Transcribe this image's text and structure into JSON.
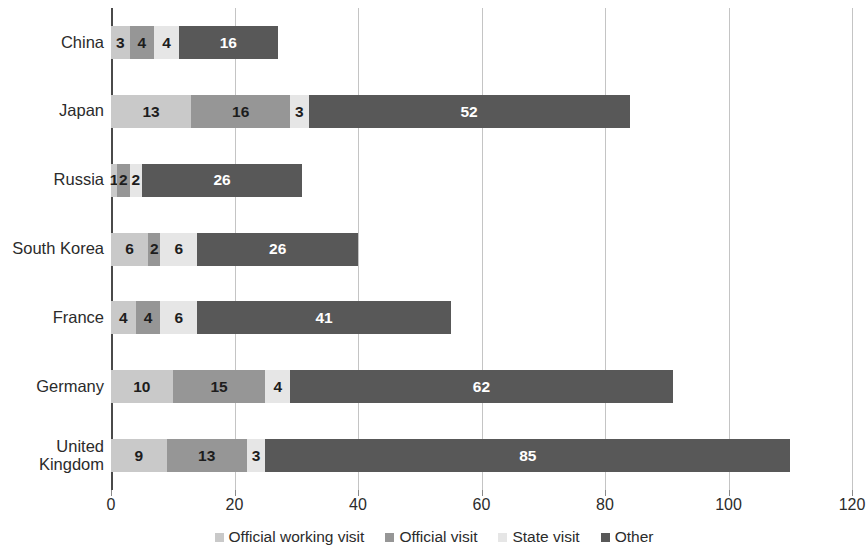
{
  "chart_data": {
    "type": "bar",
    "orientation": "horizontal",
    "stacked": true,
    "title": "",
    "subtitle": "",
    "xlabel": "",
    "ylabel": "",
    "xlim": [
      0,
      120
    ],
    "xticks": [
      "0",
      "20",
      "40",
      "60",
      "80",
      "100",
      "120"
    ],
    "xtick_values": [
      0,
      20,
      40,
      60,
      80,
      100,
      120
    ],
    "grid": "vertical",
    "legend_position": "bottom",
    "categories": [
      "China",
      "Japan",
      "Russia",
      "South Korea",
      "France",
      "Germany",
      "United\nKingdom"
    ],
    "series": [
      {
        "name": "Official working visit",
        "color": "#c9c9c9",
        "text_on_dark": false,
        "values": [
          3,
          13,
          1,
          6,
          4,
          10,
          9
        ]
      },
      {
        "name": "Official visit",
        "color": "#969696",
        "text_on_dark": false,
        "values": [
          4,
          16,
          2,
          2,
          4,
          15,
          13
        ]
      },
      {
        "name": "State visit",
        "color": "#e6e6e6",
        "text_on_dark": false,
        "values": [
          4,
          3,
          2,
          6,
          6,
          4,
          3
        ]
      },
      {
        "name": "Other",
        "color": "#585858",
        "text_on_dark": true,
        "values": [
          16,
          52,
          26,
          26,
          41,
          62,
          85
        ]
      }
    ],
    "totals": [
      27,
      84,
      31,
      40,
      55,
      91,
      110
    ],
    "axis_color": "#4a4a4a",
    "gridline_color": "#c4c4c4",
    "background": "#ffffff"
  }
}
